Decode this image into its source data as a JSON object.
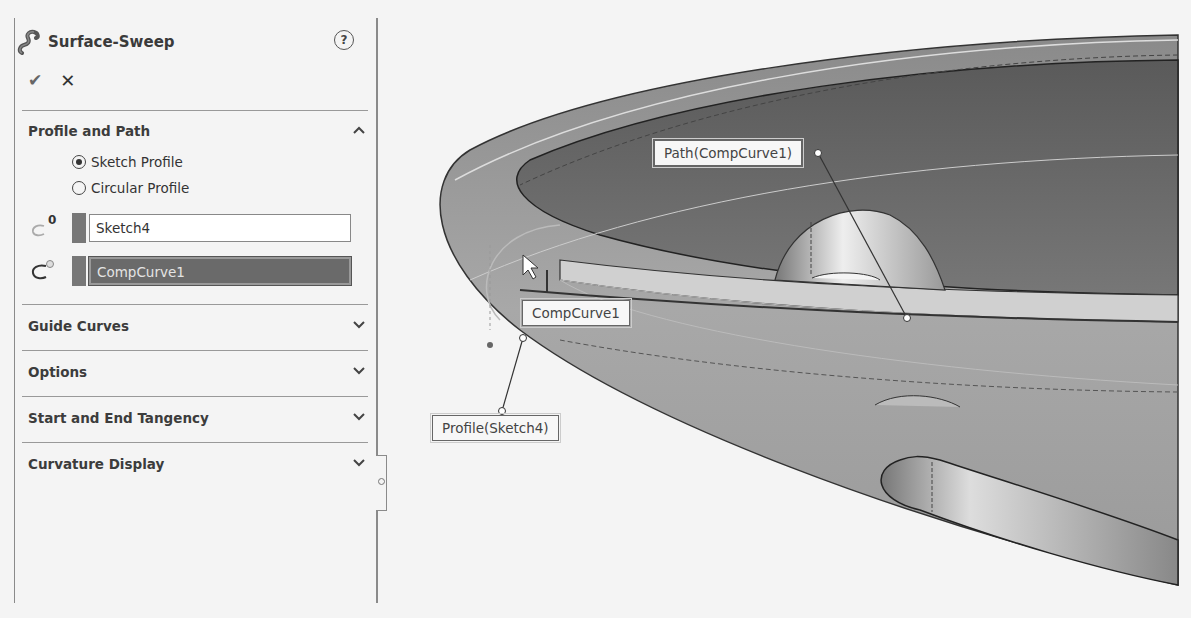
{
  "property_manager": {
    "title": "Surface-Sweep",
    "help_icon": "?",
    "ok_icon": "✔",
    "cancel_icon": "✕",
    "sections": {
      "profile_and_path": {
        "label": "Profile and Path",
        "expanded": true,
        "profile_options": [
          {
            "label": "Sketch Profile",
            "selected": true
          },
          {
            "label": "Circular Profile",
            "selected": false
          }
        ],
        "profile_field": {
          "value": "Sketch4"
        },
        "path_field": {
          "value": "CompCurve1",
          "active": true
        }
      },
      "guide_curves": {
        "label": "Guide Curves",
        "expanded": false
      },
      "options": {
        "label": "Options",
        "expanded": false
      },
      "start_end_tangency": {
        "label": "Start and End Tangency",
        "expanded": false
      },
      "curvature_display": {
        "label": "Curvature Display",
        "expanded": false
      }
    }
  },
  "viewport": {
    "callouts": {
      "path": "Path(CompCurve1)",
      "hover": "CompCurve1",
      "profile": "Profile(Sketch4)"
    }
  },
  "colors": {
    "panel_bg": "#f4f4f4",
    "active_field_bg": "#6a6a6a",
    "swatch": "#777777"
  }
}
